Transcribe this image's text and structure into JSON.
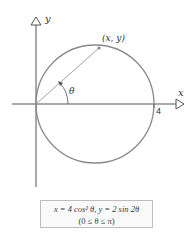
{
  "diagram": {
    "axes": {
      "x_label": "x",
      "y_label": "y",
      "x_tick_label": "4"
    },
    "point_label": "(x, y)",
    "angle_label": "θ",
    "equation": {
      "line1": "x = 4 cos² θ, y = 2 sin 2θ",
      "line2": "(0 ≤ θ ≤ π)"
    },
    "colors": {
      "axis": "#555555",
      "circle": "#8a8a8a",
      "radius_line": "#9a9a9a",
      "text": "#333333",
      "box_border": "#bdbdbd"
    }
  }
}
